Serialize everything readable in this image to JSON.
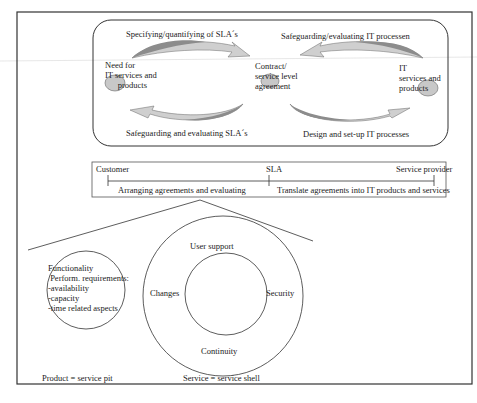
{
  "diagram": {
    "cycle": {
      "top_left_label": "Specifying/quantifying of SLA´s",
      "top_right_label": "Safeguarding/evaluating IT processen",
      "bottom_left_label": "Safeguarding and evaluating SLA´s",
      "bottom_right_label": "Design and set-up IT processes",
      "node_left": "Need for\nIT services and\n      products",
      "node_center": "Contract/\nservice level\nagreement",
      "node_right": "IT\nservices and\nproducts"
    },
    "sla_bar": {
      "customer": "Customer",
      "sla": "SLA",
      "provider": "Service provider",
      "left_activity": "Arranging agreements and evaluating",
      "right_activity": "Translate agreements into IT products and services"
    },
    "product": {
      "lines": "Functionality\n Perform. requirements:\n-availability\n-capacity\n-time related aspects",
      "caption": "Product = service pit"
    },
    "service": {
      "top": "User support",
      "left": "Changes",
      "right": "Security",
      "bottom": "Continuity",
      "caption": "Service =  service shell"
    },
    "colors": {
      "arrow_dark": "#8c8c8c",
      "arrow_light": "#cfcfcf",
      "node_fill": "#c8c8c8",
      "stroke": "#333333"
    }
  }
}
